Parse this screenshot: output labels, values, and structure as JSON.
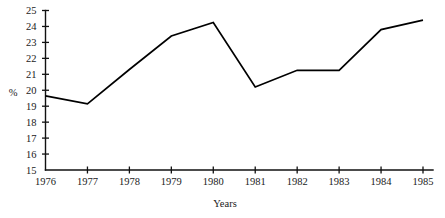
{
  "chart_data": {
    "type": "line",
    "title": "",
    "xlabel": "Years",
    "ylabel": "%",
    "categories": [
      "1976",
      "1977",
      "1978",
      "1979",
      "1980",
      "1981",
      "1982",
      "1983",
      "1984",
      "1985"
    ],
    "x": [
      1976,
      1977,
      1978,
      1979,
      1980,
      1981,
      1982,
      1983,
      1984,
      1985
    ],
    "values": [
      19.65,
      19.15,
      21.3,
      23.4,
      24.25,
      20.2,
      21.25,
      21.25,
      23.8,
      24.4
    ],
    "series": [
      {
        "name": "%",
        "values": [
          19.65,
          19.15,
          21.3,
          23.4,
          24.25,
          20.2,
          21.25,
          21.25,
          23.8,
          24.4
        ]
      }
    ],
    "xlim": [
      1976,
      1985
    ],
    "ylim": [
      15,
      25
    ],
    "ytick_labels": [
      "15",
      "16",
      "17",
      "18",
      "19",
      "20",
      "21",
      "22",
      "23",
      "24",
      "25"
    ],
    "yticks": [
      15,
      16,
      17,
      18,
      19,
      20,
      21,
      22,
      23,
      24,
      25
    ],
    "xtick_labels": [
      "1976",
      "1977",
      "1978",
      "1979",
      "1980",
      "1981",
      "1982",
      "1983",
      "1984",
      "1985"
    ],
    "grid": false,
    "legend": false,
    "legend_position": "none",
    "line_color": "#000000",
    "background_color": "#ffffff",
    "axis_color": "#111111"
  }
}
